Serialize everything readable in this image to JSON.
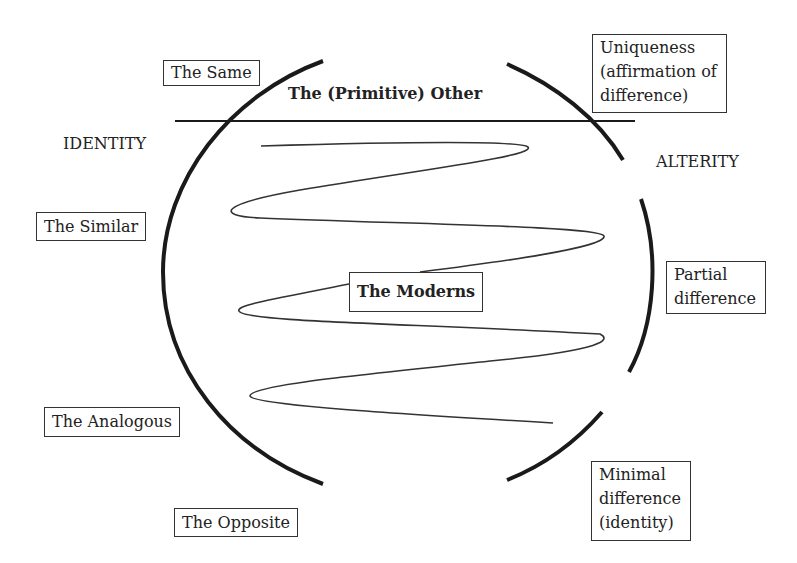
{
  "diagram": {
    "title_label": "The (Primitive) Other",
    "center_label": "The Moderns",
    "axes": {
      "left": "IDENTITY",
      "right": "ALTERITY"
    },
    "left_boxes": [
      {
        "id": "same",
        "label": "The Same"
      },
      {
        "id": "similar",
        "label": "The Similar"
      },
      {
        "id": "analogous",
        "label": "The Analogous"
      },
      {
        "id": "opposite",
        "label": "The Opposite"
      }
    ],
    "right_boxes": [
      {
        "id": "uniqueness",
        "lines": [
          "Uniqueness",
          "(affirmation of",
          "difference)"
        ]
      },
      {
        "id": "partial",
        "lines": [
          "Partial",
          "difference"
        ]
      },
      {
        "id": "minimal",
        "lines": [
          "Minimal",
          "difference",
          "(identity)"
        ]
      }
    ],
    "colors": {
      "stroke": "#1a1a1a",
      "text": "#222222",
      "background": "#ffffff"
    }
  }
}
